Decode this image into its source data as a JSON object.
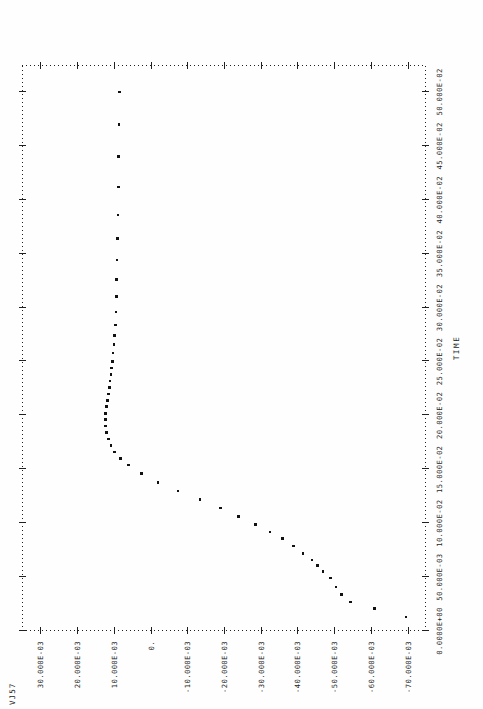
{
  "plot": {
    "title": "VJ57",
    "device": "line-printer-scatter-plot"
  },
  "chart_data": {
    "type": "scatter",
    "title": "VJ57",
    "xlabel": "TIME",
    "ylabel": "VJ57",
    "xlim": [
      0.0,
      0.525
    ],
    "ylim": [
      -0.075,
      0.035
    ],
    "grid": false,
    "legend": null,
    "xticks": [
      0.0,
      0.05,
      0.1,
      0.15,
      0.2,
      0.25,
      0.3,
      0.35,
      0.4,
      0.45,
      0.5
    ],
    "xticklabels": [
      "0.0000E+00",
      "50.000E-03",
      "10.000E-02",
      "15.000E-02",
      "20.000E-02",
      "25.000E-02",
      "30.000E-02",
      "35.000E-02",
      "40.000E-02",
      "45.000E-02",
      "50.000E-02"
    ],
    "yticks": [
      0.03,
      0.02,
      0.01,
      0.0,
      -0.01,
      -0.02,
      -0.03,
      -0.04,
      -0.05,
      -0.06,
      -0.07
    ],
    "yticklabels": [
      "30.000E-03",
      "20.000E-03",
      "10.000E-03",
      "0.",
      "-10.000E-03",
      "-20.000E-03",
      "-30.000E-03",
      "-40.000E-03",
      "-50.000E-03",
      "-60.000E-03",
      "-70.000E-03"
    ],
    "x": [
      0.013,
      0.021,
      0.027,
      0.034,
      0.041,
      0.049,
      0.055,
      0.061,
      0.066,
      0.072,
      0.079,
      0.086,
      0.092,
      0.099,
      0.106,
      0.114,
      0.122,
      0.13,
      0.138,
      0.146,
      0.154,
      0.16,
      0.166,
      0.172,
      0.178,
      0.184,
      0.19,
      0.196,
      0.202,
      0.208,
      0.214,
      0.22,
      0.226,
      0.232,
      0.238,
      0.244,
      0.25,
      0.258,
      0.266,
      0.274,
      0.284,
      0.296,
      0.31,
      0.326,
      0.344,
      0.364,
      0.386,
      0.412,
      0.44,
      0.47,
      0.5
    ],
    "y": [
      -0.0695,
      -0.061,
      -0.0545,
      -0.052,
      -0.0505,
      -0.049,
      -0.047,
      -0.0455,
      -0.044,
      -0.0415,
      -0.039,
      -0.036,
      -0.0325,
      -0.0285,
      -0.024,
      -0.019,
      -0.0135,
      -0.0075,
      -0.002,
      0.0025,
      0.006,
      0.0082,
      0.0098,
      0.0108,
      0.0115,
      0.012,
      0.0122,
      0.0123,
      0.0122,
      0.012,
      0.0118,
      0.0115,
      0.0112,
      0.011,
      0.0108,
      0.0106,
      0.0104,
      0.0102,
      0.01,
      0.0098,
      0.0096,
      0.0094,
      0.0093,
      0.0092,
      0.0091,
      0.009,
      0.0089,
      0.0088,
      0.0087,
      0.0086,
      0.0085
    ]
  }
}
